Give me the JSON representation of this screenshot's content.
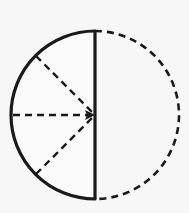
{
  "figure": {
    "title": "Circle with solid left semicircle and dashed right semicircle",
    "background_color": "#f7f7f8",
    "stroke_color": "#1a1a1a",
    "fill_color": "#fbfbfc"
  },
  "geometry": {
    "canvas_width": 189,
    "canvas_height": 213,
    "center": {
      "x": 95,
      "y": 115
    },
    "radius": 84,
    "top_point": {
      "x": 95,
      "y": 31
    },
    "bottom_point": {
      "x": 95,
      "y": 199
    },
    "left_point": {
      "x": 11,
      "y": 115
    }
  },
  "elements": {
    "solid_arc": {
      "name": "left-semicircle-arc",
      "style": "solid",
      "stroke_width": 3.2,
      "start_angle_deg": 90,
      "end_angle_deg": 270,
      "path": "M 95 31 A 84 84 0 0 0 95 199"
    },
    "dashed_arc": {
      "name": "right-semicircle-arc",
      "style": "dashed",
      "stroke_width": 2.6,
      "dash_pattern": "7 5",
      "start_angle_deg": 90,
      "end_angle_deg": -90,
      "path": "M 95 31 A 84 84 0 0 1 95 199"
    },
    "diameter": {
      "name": "vertical-diameter",
      "style": "solid",
      "stroke_width": 3.2,
      "x1": 95,
      "y1": 31,
      "x2": 95,
      "y2": 199
    },
    "radii": [
      {
        "name": "upper-left-radius",
        "style": "dashed",
        "stroke_width": 2.4,
        "dash_pattern": "7 5",
        "x1": 36,
        "y1": 56,
        "x2": 95,
        "y2": 115,
        "angle_deg": 135
      },
      {
        "name": "horizontal-radius",
        "style": "dashed",
        "stroke_width": 2.4,
        "dash_pattern": "7 5",
        "x1": 13,
        "y1": 115,
        "x2": 95,
        "y2": 115,
        "angle_deg": 180,
        "has_arrowhead": true,
        "arrow_direction": "right"
      },
      {
        "name": "lower-left-radius",
        "style": "dashed",
        "stroke_width": 2.4,
        "dash_pattern": "7 5",
        "x1": 36,
        "y1": 174,
        "x2": 95,
        "y2": 115,
        "angle_deg": 225
      }
    ],
    "arrowhead": {
      "name": "center-arrowhead",
      "tip": {
        "x": 95,
        "y": 115
      },
      "size": 9,
      "points": "95,115 85,110 87,115 85,120"
    }
  },
  "labels": {
    "none_visible": ""
  }
}
